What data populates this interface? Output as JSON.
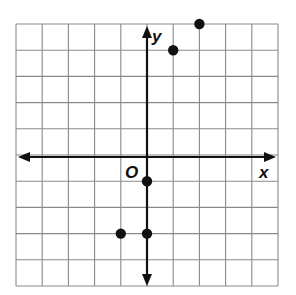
{
  "chart_data": {
    "type": "scatter",
    "title": "",
    "xlabel": "x",
    "ylabel": "y",
    "origin_label": "O",
    "grid": true,
    "xlim": [
      -5,
      5
    ],
    "ylim": [
      -5,
      5
    ],
    "points": [
      {
        "x": 1,
        "y": 4
      },
      {
        "x": 2,
        "y": 5
      },
      {
        "x": 0,
        "y": -1
      },
      {
        "x": -1,
        "y": -3
      },
      {
        "x": 0,
        "y": -3
      }
    ]
  },
  "style": {
    "grid_color": "#8a8a8a",
    "axis_color": "#111111",
    "point_color": "#111111"
  }
}
